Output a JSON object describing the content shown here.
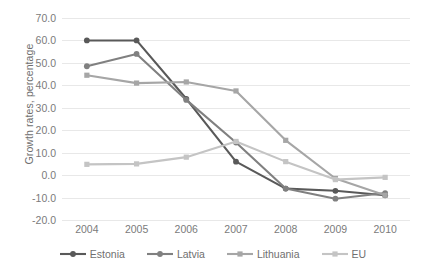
{
  "chart_data": {
    "type": "line",
    "title": "",
    "xlabel": "",
    "ylabel": "Growth rates, percentage",
    "categories": [
      "2004",
      "2005",
      "2006",
      "2007",
      "2008",
      "2009",
      "2010"
    ],
    "x": [
      2004,
      2005,
      2006,
      2007,
      2008,
      2009,
      2010
    ],
    "ylim": [
      -20.0,
      70.0
    ],
    "ytick_step": 10.0,
    "yticks": [
      "70.0",
      "60.0",
      "50.0",
      "40.0",
      "30.0",
      "20.0",
      "10.0",
      "0.0",
      "-10.0",
      "-20.0"
    ],
    "ytick_values": [
      70.0,
      60.0,
      50.0,
      40.0,
      30.0,
      20.0,
      10.0,
      0.0,
      -10.0,
      -20.0
    ],
    "grid": "horizontal",
    "legend_position": "bottom",
    "series": [
      {
        "name": "Estonia",
        "color": "#595959",
        "marker": "circle",
        "values": [
          60.0,
          60.0,
          34.0,
          6.0,
          -6.0,
          -7.0,
          -9.0
        ]
      },
      {
        "name": "Latvia",
        "color": "#808080",
        "marker": "circle",
        "values": [
          48.5,
          54.0,
          33.5,
          14.5,
          -6.0,
          -10.5,
          -8.0
        ]
      },
      {
        "name": "Lithuania",
        "color": "#a6a6a6",
        "marker": "square",
        "values": [
          44.5,
          41.0,
          41.5,
          37.5,
          15.5,
          -1.5,
          -9.0
        ]
      },
      {
        "name": "EU",
        "color": "#c4c4c4",
        "marker": "square",
        "values": [
          4.8,
          5.0,
          8.0,
          15.0,
          6.0,
          -2.0,
          -1.0
        ]
      }
    ]
  },
  "legend": {
    "items": [
      {
        "label": "Estonia"
      },
      {
        "label": "Latvia"
      },
      {
        "label": "Lithuania"
      },
      {
        "label": "EU"
      }
    ]
  }
}
